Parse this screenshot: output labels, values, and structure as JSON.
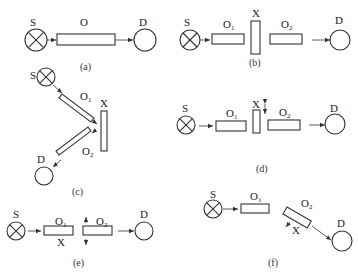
{
  "figure": {
    "panels": [
      {
        "id": "a",
        "caption": "(a)",
        "source": "S",
        "detector": "D",
        "elements": [
          {
            "label": "O",
            "sub": ""
          }
        ],
        "sample": null
      },
      {
        "id": "b",
        "caption": "(b)",
        "source": "S",
        "detector": "D",
        "elements": [
          {
            "label": "O",
            "sub": "1"
          },
          {
            "label": "O",
            "sub": "2"
          }
        ],
        "sample": "X"
      },
      {
        "id": "c",
        "caption": "(c)",
        "source": "S",
        "detector": "D",
        "elements": [
          {
            "label": "O",
            "sub": "1"
          },
          {
            "label": "O",
            "sub": "2"
          }
        ],
        "sample": "X"
      },
      {
        "id": "d",
        "caption": "(d)",
        "source": "S",
        "detector": "D",
        "elements": [
          {
            "label": "O",
            "sub": "1"
          },
          {
            "label": "O",
            "sub": "2"
          }
        ],
        "sample": "X"
      },
      {
        "id": "e",
        "caption": "(e)",
        "source": "S",
        "detector": "D",
        "elements": [
          {
            "label": "O",
            "sub": "1"
          },
          {
            "label": "O",
            "sub": "2"
          }
        ],
        "sample": "X"
      },
      {
        "id": "f",
        "caption": "(f)",
        "source": "S",
        "detector": "D",
        "elements": [
          {
            "label": "O",
            "sub": "1"
          },
          {
            "label": "O",
            "sub": "2"
          }
        ],
        "sample": "X"
      }
    ]
  }
}
